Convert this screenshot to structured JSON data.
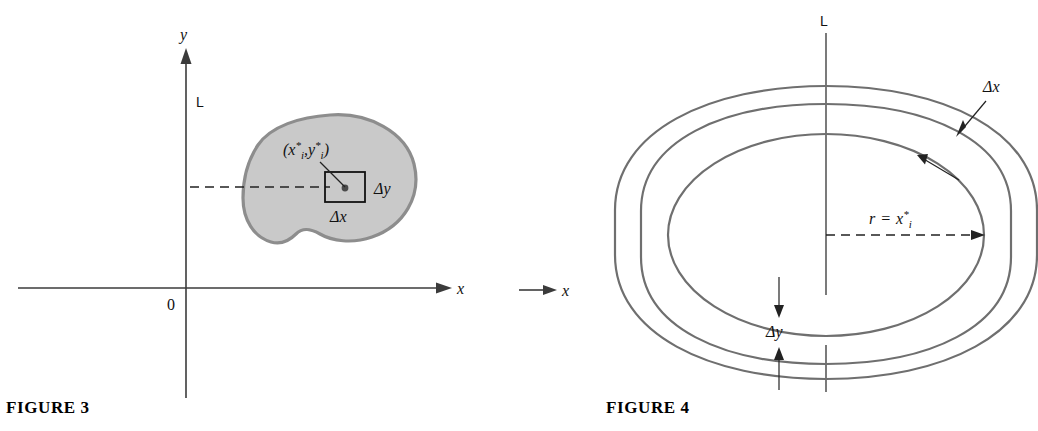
{
  "figures": [
    {
      "id": "figure-3",
      "caption": "FIGURE 3",
      "axes": {
        "y_axis_label": "y",
        "x_axis_label": "x",
        "origin_label": "0",
        "line_label": "L"
      },
      "annotations": {
        "sample_point_open": "(",
        "sample_point_x_base": "x",
        "sample_point_x_star": "*",
        "sample_point_x_sub": "i",
        "sample_point_comma": ",",
        "sample_point_y_base": "y",
        "sample_point_y_star": "*",
        "sample_point_y_sub": "i",
        "sample_point_close": ")",
        "delta_y": "Δy",
        "delta_x": "Δx"
      },
      "region": {
        "fill_color": "#c9c9c9",
        "outline_color": "#8d8d8d"
      }
    },
    {
      "id": "figure-4",
      "caption": "FIGURE 4",
      "axes": {
        "line_label": "L",
        "x_axis_label": "x"
      },
      "annotations": {
        "delta_x": "Δx",
        "delta_y": "Δy",
        "radius_r": "r",
        "radius_equals": "=",
        "radius_x_base": "x",
        "radius_x_star": "*",
        "radius_x_sub": "i"
      },
      "ring": {
        "stroke_color": "#6f6f6f"
      }
    }
  ],
  "colors": {
    "background": "#ffffff",
    "ink": "#111111",
    "region_fill": "#c9c9c9",
    "region_outline": "#8d8d8d",
    "ring_outline": "#6f6f6f",
    "axis": "#3b3b3b"
  }
}
